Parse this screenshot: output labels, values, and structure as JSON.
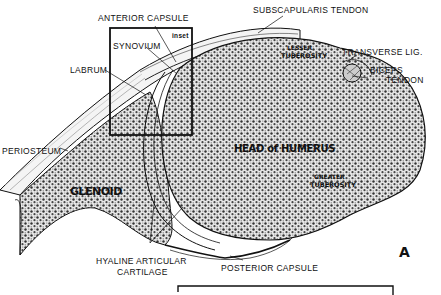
{
  "diagram": {
    "type": "anatomical cross-section (shoulder joint)",
    "figure_letter": "A",
    "labels": {
      "anterior_capsule": "ANTERIOR CAPSULE",
      "subscapularis_tendon": "SUBSCAPULARIS TENDON",
      "inset": "inset",
      "synovium": "SYNOVIUM",
      "labrum": "LABRUM",
      "lesser_tuberosity_line1": "LESSER",
      "lesser_tuberosity_line2": "TUBEROSITY",
      "transverse_lig": "TRANSVERSE LIG.",
      "biceps_line1": "BICEPS",
      "biceps_line2": "TENDON",
      "periosteum": "PERIOSTEUM",
      "head_of_humerus": "HEAD of HUMERUS",
      "greater_tuberosity_line1": "GREATER",
      "greater_tuberosity_line2": "TUBEROSITY",
      "glenoid": "GLENOID",
      "hyaline_line1": "HYALINE  ARTICULAR",
      "hyaline_line2": "CARTILAGE",
      "posterior_capsule": "POSTERIOR  CAPSULE"
    },
    "colors": {
      "ink": "#111111",
      "background": "#ffffff",
      "stipple": "#9a9a9a"
    }
  }
}
